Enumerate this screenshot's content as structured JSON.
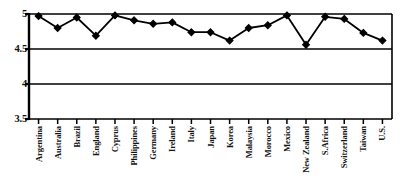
{
  "chart_data": {
    "type": "line",
    "title": "",
    "subtitle": "",
    "xlabel": "",
    "ylabel": "",
    "ylim": [
      3.5,
      5.0
    ],
    "yticks": [
      3.5,
      4,
      4.5,
      5
    ],
    "ytick_labels": [
      "3.5",
      "4",
      "4.5",
      "5"
    ],
    "grid": true,
    "legend": false,
    "marker": "diamond",
    "line_color": "#000000",
    "marker_color": "#000000",
    "categories": [
      "Argentina",
      "Australia",
      "Brazil",
      "England",
      "Cyprus",
      "Philippines",
      "Germany",
      "Ireland",
      "Italy",
      "Japan",
      "Korea",
      "Malaysia",
      "Morocco",
      "Mexico",
      "New Zealand",
      "S.Africa",
      "Switzerland",
      "Taiwan",
      "U.S."
    ],
    "values": [
      4.97,
      4.8,
      4.95,
      4.69,
      4.98,
      4.91,
      4.86,
      4.88,
      4.74,
      4.74,
      4.62,
      4.8,
      4.84,
      4.98,
      4.56,
      4.96,
      4.93,
      4.73,
      4.62
    ]
  },
  "colors": {
    "axis": "#000000",
    "grid": "#000000",
    "background": "#ffffff",
    "text": "#111111"
  }
}
